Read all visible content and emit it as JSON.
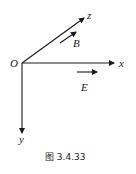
{
  "diagram": {
    "origin_label": "O",
    "axes": {
      "x": {
        "label": "x"
      },
      "y": {
        "label": "y"
      },
      "z": {
        "label": "z"
      }
    },
    "vectors": {
      "B": {
        "label": "B",
        "direction": "along z"
      },
      "E": {
        "label": "E",
        "direction": "along x"
      }
    },
    "caption": "图 3.4.33",
    "colors": {
      "ink": "#1a1a1a",
      "background": "#ffffff"
    }
  }
}
